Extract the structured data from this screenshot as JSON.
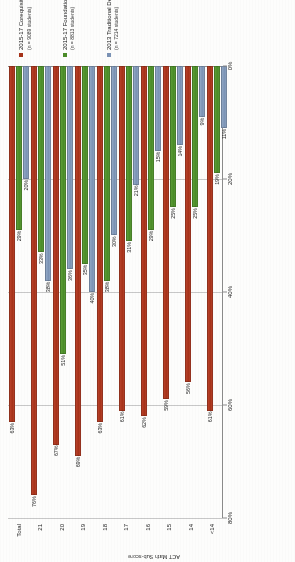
{
  "chart_data": {
    "type": "bar",
    "orientation": "horizontal",
    "title": "",
    "xlabel": "",
    "ylabel": "ACT Math Sub-score",
    "xlim": [
      0,
      80
    ],
    "grid": true,
    "legend_position": "right",
    "tick_labels": [
      "80%",
      "60%",
      "40%",
      "20%",
      "0%"
    ],
    "tick_values": [
      80,
      60,
      40,
      20,
      0
    ],
    "categories": [
      "Total",
      "21",
      "20",
      "19",
      "18",
      "17",
      "16",
      "15",
      "14",
      "<14"
    ],
    "series": [
      {
        "name": "2015-17 Corequisite",
        "sub": "(n = 9089 students)",
        "color": "#a63219",
        "values": [
          63,
          76,
          67,
          69,
          63,
          61,
          62,
          59,
          56,
          61
        ],
        "labels": [
          "63%",
          "76%",
          "67%",
          "69%",
          "63%",
          "61%",
          "62%",
          "59%",
          "56%",
          "61%"
        ]
      },
      {
        "name": "2015-17 Foundations",
        "sub": "(n = 8813 students)",
        "color": "#4b8c28",
        "values": [
          29,
          33,
          51,
          35,
          38,
          31,
          29,
          25,
          25,
          19
        ],
        "labels": [
          "29%",
          "33%",
          "51%",
          "35%",
          "38%",
          "31%",
          "29%",
          "25%",
          "25%",
          "19%"
        ]
      },
      {
        "name": "2013 Traditional DevEd",
        "sub": "(n = 7214 students)",
        "color": "#7b93b5",
        "values": [
          20,
          38,
          36,
          40,
          30,
          21,
          15,
          14,
          9,
          11
        ],
        "labels": [
          "20%",
          "38%",
          "36%",
          "40%",
          "30%",
          "21%",
          "15%",
          "14%",
          "9%",
          "11%"
        ]
      }
    ]
  }
}
